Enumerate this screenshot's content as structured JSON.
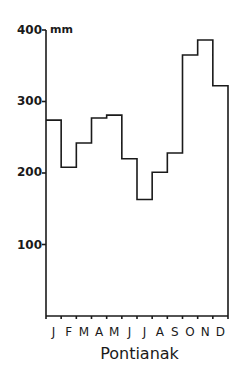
{
  "chart_data": {
    "type": "bar",
    "style": "step histogram (outline only)",
    "title": "Pontianak",
    "xlabel": "",
    "ylabel": "mm",
    "unit": "mm",
    "categories": [
      "J",
      "F",
      "M",
      "A",
      "M",
      "J",
      "J",
      "A",
      "S",
      "O",
      "N",
      "D"
    ],
    "values": [
      274,
      208,
      242,
      277,
      281,
      220,
      163,
      201,
      228,
      365,
      386,
      322
    ],
    "yticks": [
      100,
      200,
      300,
      400
    ],
    "ytick_labels": [
      "100",
      "200",
      "300",
      "400"
    ],
    "ylim": [
      0,
      400
    ],
    "grid": false,
    "legend": null
  },
  "labels": {
    "y100": "100",
    "y200": "200",
    "y300": "300",
    "y400": "400",
    "unit": "mm",
    "months": [
      "J",
      "F",
      "M",
      "A",
      "M",
      "J",
      "J",
      "A",
      "S",
      "O",
      "N",
      "D"
    ],
    "title": "Pontianak"
  },
  "colors": {
    "line": "#1a1a1a",
    "background": "#ffffff"
  }
}
